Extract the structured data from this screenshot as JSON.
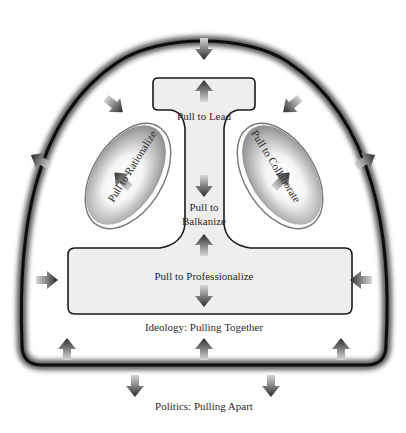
{
  "diagram": {
    "labels": {
      "pull_to_lead": "Pull to Lead",
      "pull_to_rationalize": "Pull to Rationalize",
      "pull_to_collaborate": "Pull to Collaborate",
      "pull_to_balkanize_line1": "Pull to",
      "pull_to_balkanize_line2": "Balkanize",
      "pull_to_professionalize": "Pull to Professionalize",
      "ideology": "Ideology: Pulling Together",
      "politics": "Politics: Pulling Apart"
    },
    "colors": {
      "outline": "#111111",
      "inner_fill": "#eeeeee",
      "ellipse_light": "#ffffff",
      "ellipse_dark": "#8a8a8a",
      "arrow_dark": "#333333",
      "arrow_light": "#cfcfcf",
      "text": "#2a2a2a"
    },
    "arrows": {
      "inward": [
        "top",
        "upper-left",
        "upper-right",
        "mid-left",
        "mid-right",
        "bottom-left-up",
        "bottom-center-up",
        "bottom-right-up"
      ],
      "outward": [
        "left",
        "right",
        "bottom-left-down",
        "bottom-right-down"
      ],
      "internal": [
        "lead-up",
        "rationalize-up-left",
        "collaborate-up-right",
        "balkanize-down",
        "balkanize-up",
        "professionalize-down"
      ]
    }
  }
}
